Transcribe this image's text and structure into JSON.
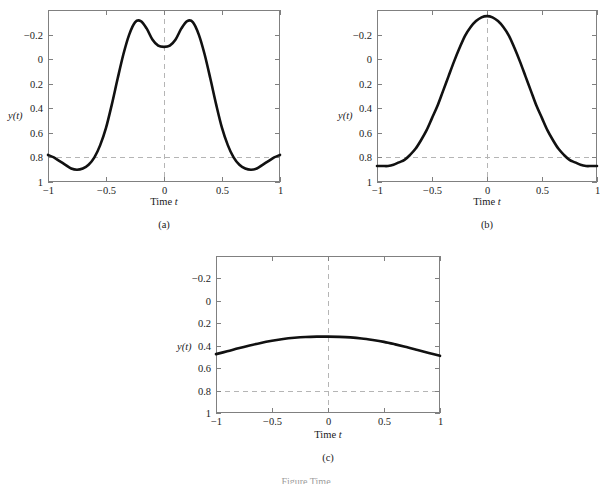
{
  "figure": {
    "background_color": "#ffffff",
    "curve_color": "#111111",
    "axis_color": "#808080",
    "grid_color": "#b5b5b5",
    "caption_partial": "Figure  Time"
  },
  "panels": [
    {
      "id": "a",
      "caption": "(a)",
      "y_axis_label": "y(t)",
      "x_axis_title_prefix": "Time ",
      "x_axis_title_var": "t",
      "x_ticks": [
        "-1",
        "-0.5",
        "0",
        "0.5",
        "1"
      ],
      "y_ticks": [
        "1",
        "0.8",
        "0.6",
        "0.4",
        "0.2",
        "0",
        "-0.2"
      ]
    },
    {
      "id": "b",
      "caption": "(b)",
      "y_axis_label": "y(t)",
      "x_axis_title_prefix": "Time ",
      "x_axis_title_var": "t",
      "x_ticks": [
        "-1",
        "-0.5",
        "0",
        "0.5",
        "1"
      ],
      "y_ticks": [
        "1",
        "0.8",
        "0.6",
        "0.4",
        "0.2",
        "0",
        "-0.2"
      ]
    },
    {
      "id": "c",
      "caption": "(c)",
      "y_axis_label": "y(t)",
      "x_axis_title_prefix": "Time ",
      "x_axis_title_var": "t",
      "x_ticks": [
        "-1",
        "-0.5",
        "0",
        "0.5",
        "1"
      ],
      "y_ticks": [
        "1",
        "0.8",
        "0.6",
        "0.4",
        "0.2",
        "0",
        "-0.2"
      ]
    }
  ],
  "chart_data": [
    {
      "type": "line",
      "panel": "a",
      "title": "(a)",
      "xlabel": "Time t",
      "ylabel": "y(t)",
      "xlim": [
        -1,
        1
      ],
      "ylim": [
        -0.2,
        1.2
      ],
      "xticks": [
        -1,
        -0.5,
        0,
        0.5,
        1
      ],
      "yticks": [
        -0.2,
        0,
        0.2,
        0.4,
        0.6,
        0.8,
        1
      ],
      "grid": false,
      "zero_gridlines": {
        "x": 0,
        "y": 0,
        "style": "dashed"
      },
      "legend": null,
      "series": [
        {
          "name": "y(t)",
          "x": [
            -1.0,
            -0.95,
            -0.9,
            -0.85,
            -0.8,
            -0.75,
            -0.7,
            -0.65,
            -0.6,
            -0.55,
            -0.5,
            -0.45,
            -0.4,
            -0.35,
            -0.3,
            -0.25,
            -0.2,
            -0.15,
            -0.1,
            -0.05,
            0.0,
            0.05,
            0.1,
            0.15,
            0.2,
            0.25,
            0.3,
            0.35,
            0.4,
            0.45,
            0.5,
            0.55,
            0.6,
            0.65,
            0.7,
            0.75,
            0.8,
            0.85,
            0.9,
            0.95,
            1.0
          ],
          "y": [
            0.02,
            0.0,
            -0.03,
            -0.06,
            -0.09,
            -0.1,
            -0.09,
            -0.06,
            0.0,
            0.1,
            0.24,
            0.43,
            0.64,
            0.84,
            1.0,
            1.1,
            1.11,
            1.05,
            0.96,
            0.91,
            0.9,
            0.91,
            0.96,
            1.05,
            1.11,
            1.1,
            1.0,
            0.84,
            0.64,
            0.43,
            0.24,
            0.1,
            0.0,
            -0.06,
            -0.09,
            -0.1,
            -0.09,
            -0.06,
            -0.03,
            0.0,
            0.02
          ]
        }
      ]
    },
    {
      "type": "line",
      "panel": "b",
      "title": "(b)",
      "xlabel": "Time t",
      "ylabel": "y(t)",
      "xlim": [
        -1,
        1
      ],
      "ylim": [
        -0.2,
        1.2
      ],
      "xticks": [
        -1,
        -0.5,
        0,
        0.5,
        1
      ],
      "yticks": [
        -0.2,
        0,
        0.2,
        0.4,
        0.6,
        0.8,
        1
      ],
      "grid": false,
      "zero_gridlines": {
        "x": 0,
        "y": 0,
        "style": "dashed"
      },
      "legend": null,
      "series": [
        {
          "name": "y(t)",
          "x": [
            -1.0,
            -0.95,
            -0.9,
            -0.85,
            -0.8,
            -0.75,
            -0.7,
            -0.65,
            -0.6,
            -0.55,
            -0.5,
            -0.45,
            -0.4,
            -0.35,
            -0.3,
            -0.25,
            -0.2,
            -0.15,
            -0.1,
            -0.05,
            0.0,
            0.05,
            0.1,
            0.15,
            0.2,
            0.25,
            0.3,
            0.35,
            0.4,
            0.45,
            0.5,
            0.55,
            0.6,
            0.65,
            0.7,
            0.75,
            0.8,
            0.85,
            0.9,
            0.95,
            1.0
          ],
          "y": [
            -0.07,
            -0.07,
            -0.07,
            -0.06,
            -0.04,
            -0.02,
            0.02,
            0.07,
            0.14,
            0.22,
            0.32,
            0.42,
            0.54,
            0.66,
            0.78,
            0.89,
            0.99,
            1.06,
            1.11,
            1.14,
            1.15,
            1.14,
            1.11,
            1.06,
            0.99,
            0.89,
            0.78,
            0.66,
            0.54,
            0.42,
            0.32,
            0.22,
            0.14,
            0.07,
            0.02,
            -0.02,
            -0.04,
            -0.06,
            -0.07,
            -0.07,
            -0.07
          ]
        }
      ]
    },
    {
      "type": "line",
      "panel": "c",
      "title": "(c)",
      "xlabel": "Time t",
      "ylabel": "y(t)",
      "xlim": [
        -1,
        1
      ],
      "ylim": [
        -0.2,
        1.2
      ],
      "xticks": [
        -1,
        -0.5,
        0,
        0.5,
        1
      ],
      "yticks": [
        -0.2,
        0,
        0.2,
        0.4,
        0.6,
        0.8,
        1
      ],
      "grid": false,
      "zero_gridlines": {
        "x": 0,
        "y": 0,
        "style": "dashed"
      },
      "legend": null,
      "series": [
        {
          "name": "y(t)",
          "x": [
            -1.0,
            -0.9,
            -0.8,
            -0.7,
            -0.6,
            -0.5,
            -0.4,
            -0.3,
            -0.2,
            -0.1,
            0.0,
            0.1,
            0.2,
            0.3,
            0.4,
            0.5,
            0.6,
            0.7,
            0.8,
            0.9,
            1.0
          ],
          "y": [
            0.325,
            0.35,
            0.377,
            0.402,
            0.425,
            0.444,
            0.46,
            0.471,
            0.478,
            0.481,
            0.481,
            0.479,
            0.474,
            0.465,
            0.451,
            0.434,
            0.412,
            0.388,
            0.362,
            0.336,
            0.31
          ]
        }
      ]
    }
  ]
}
